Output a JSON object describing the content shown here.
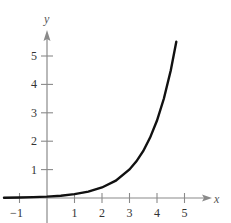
{
  "chart_data": {
    "type": "line",
    "title": "",
    "xlabel": "x",
    "ylabel": "y",
    "xlim": [
      -1.5,
      5.8
    ],
    "ylim": [
      -0.9,
      6.0
    ],
    "grid": false,
    "legend": null,
    "x_ticks": [
      -1,
      1,
      2,
      3,
      4,
      5
    ],
    "x_tick_labels": [
      "−1",
      "1",
      "2",
      "3",
      "4",
      "5"
    ],
    "y_ticks": [
      1,
      2,
      3,
      4,
      5
    ],
    "y_tick_labels": [
      "1",
      "2",
      "3",
      "4",
      "5"
    ],
    "series": [
      {
        "name": "y = e^x / 20 (estimated)",
        "x": [
          -1.5,
          -1,
          -0.5,
          0,
          0.5,
          1,
          1.5,
          2,
          2.5,
          3,
          3.25,
          3.5,
          3.75,
          4,
          4.25,
          4.5,
          4.7
        ],
        "y": [
          0.011,
          0.018,
          0.03,
          0.05,
          0.082,
          0.136,
          0.224,
          0.369,
          0.609,
          1.004,
          1.29,
          1.656,
          2.126,
          2.73,
          3.505,
          4.501,
          5.5
        ]
      }
    ],
    "colors": {
      "axis": "#8a8a8a",
      "curve": "#111111",
      "text": "#333333"
    }
  }
}
